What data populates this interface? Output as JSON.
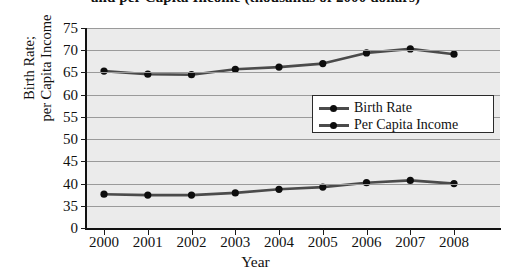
{
  "title": "and per Capita Income (thousands of 2000 dollars)",
  "axis": {
    "y_title_line1": "Birth Rate;",
    "y_title_line2": "per Capita Income",
    "x_title": "Year"
  },
  "legend": {
    "items": [
      {
        "label": "Birth Rate",
        "color": "#4b4b4b",
        "marker": "#0d0d0d"
      },
      {
        "label": "Per Capita Income",
        "color": "#4b4b4b",
        "marker": "#0d0d0d"
      }
    ]
  },
  "chart_data": {
    "type": "line",
    "title": "and per Capita Income (thousands of 2000 dollars)",
    "xlabel": "Year",
    "ylabel": "Birth Rate; per Capita Income",
    "categories": [
      "2000",
      "2001",
      "2002",
      "2003",
      "2004",
      "2005",
      "2006",
      "2007",
      "2008"
    ],
    "x": [
      2000,
      2001,
      2002,
      2003,
      2004,
      2005,
      2006,
      2007,
      2008
    ],
    "ytick_labels": [
      "75",
      "70",
      "65",
      "60",
      "55",
      "50",
      "45",
      "40",
      "35",
      "0"
    ],
    "ytick_values": [
      75,
      70,
      65,
      60,
      55,
      50,
      45,
      40,
      35,
      0
    ],
    "ylim": [
      0,
      75
    ],
    "y_axis_broken": true,
    "grid": true,
    "legend_position": "center-right",
    "plot_background": "#ebebeb",
    "series": [
      {
        "name": "Per Capita Income",
        "color": "#4b4b4b",
        "marker_color": "#0d0d0d",
        "values": [
          65.3,
          64.6,
          64.5,
          65.7,
          66.2,
          67.0,
          69.4,
          70.3,
          69.1
        ]
      },
      {
        "name": "Birth Rate",
        "color": "#4b4b4b",
        "marker_color": "#0d0d0d",
        "values": [
          37.6,
          37.4,
          37.4,
          37.9,
          38.7,
          39.2,
          40.2,
          40.7,
          40.0
        ]
      }
    ]
  }
}
